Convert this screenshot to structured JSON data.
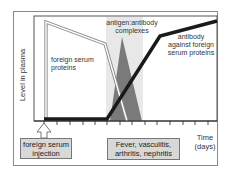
{
  "diagram": {
    "y_axis_label": "Level in plasma",
    "x_axis_label_line1": "Time",
    "x_axis_label_line2": "(days)",
    "labels": {
      "foreign_serum_proteins_1": "foreign serum",
      "foreign_serum_proteins_2": "proteins",
      "complexes_1": "antigen:antibody",
      "complexes_2": "complexes",
      "antibody_1": "antibody",
      "antibody_2": "against foreign",
      "antibody_3": "serum proteins"
    },
    "boxes": {
      "injection_1": "foreign serum",
      "injection_2": "injection",
      "symptoms_1": "Fever, vasculitis,",
      "symptoms_2": "arthritis, nephritis"
    },
    "colors": {
      "frame": "#8a8a8a",
      "antibody_line": "#1a1a1a",
      "complex_triangle": "#7a7a7a",
      "shaded_band": "#e6e6e6",
      "box_fill": "#d8d8d8"
    },
    "tick_count": 14
  }
}
